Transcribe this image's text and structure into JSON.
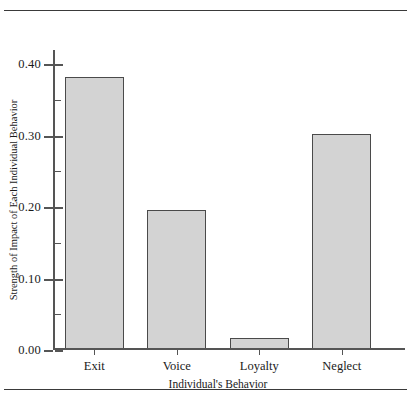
{
  "figure": {
    "caption_sliver": "",
    "bar_fill_color": "#d3d3d3",
    "bar_edge_color": "#4a4a4a",
    "axis_color": "#555555"
  },
  "chart_data": {
    "type": "bar",
    "title": "",
    "categories": [
      "Exit",
      "Voice",
      "Loyalty",
      "Neglect"
    ],
    "values": [
      0.38,
      0.193,
      0.014,
      0.3
    ],
    "xlabel": "Individual's Behavior",
    "ylabel": "Strength of Impact of Each Individual Behavior",
    "ylim": [
      0.0,
      0.42
    ],
    "ytick_values": [
      0.0,
      0.1,
      0.2,
      0.3,
      0.4
    ],
    "ytick_labels": [
      "0.00",
      "0.10",
      "0.20",
      "0.30",
      "0.40"
    ],
    "yminor_values": [
      0.05,
      0.15,
      0.25,
      0.35
    ],
    "grid": false,
    "legend": null
  }
}
